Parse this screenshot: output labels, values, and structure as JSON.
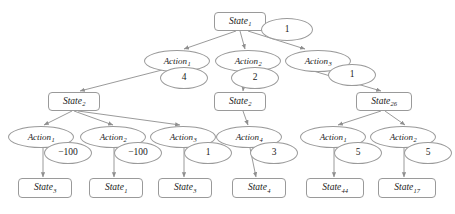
{
  "diagram": {
    "type": "expectimax-search-tree",
    "title": "",
    "node_shapes": {
      "state": "rounded-rectangle",
      "action": "ellipse",
      "value": "ellipse"
    },
    "colors": {
      "node_stroke": "#9a9a9a",
      "node_fill": "#ffffff",
      "edge_stroke": "#8f8f8f",
      "text": "#1a1a1a",
      "background": "#ffffff"
    },
    "nodes": [
      {
        "id": "s_root",
        "kind": "state",
        "base": "State",
        "sub": "1",
        "x": 214,
        "y": 12,
        "w": 52,
        "h": 19
      },
      {
        "id": "v_root",
        "kind": "value",
        "base": "1",
        "sub": "",
        "x": 261,
        "y": 18,
        "w": 52,
        "h": 23
      },
      {
        "id": "a1",
        "kind": "action",
        "base": "Action",
        "sub": "1",
        "x": 144,
        "y": 50,
        "w": 66,
        "h": 22
      },
      {
        "id": "v_a1",
        "kind": "value",
        "base": "4",
        "sub": "",
        "x": 160,
        "y": 67,
        "w": 48,
        "h": 22
      },
      {
        "id": "a2",
        "kind": "action",
        "base": "Action",
        "sub": "2",
        "x": 215,
        "y": 50,
        "w": 66,
        "h": 22
      },
      {
        "id": "v_a2",
        "kind": "value",
        "base": "2",
        "sub": "",
        "x": 231,
        "y": 67,
        "w": 48,
        "h": 22
      },
      {
        "id": "a3",
        "kind": "action",
        "base": "Action",
        "sub": "3",
        "x": 285,
        "y": 50,
        "w": 66,
        "h": 22
      },
      {
        "id": "v_a3",
        "kind": "value",
        "base": "1",
        "sub": "",
        "x": 328,
        "y": 64,
        "w": 48,
        "h": 22
      },
      {
        "id": "s_l",
        "kind": "state",
        "base": "State",
        "sub": "2",
        "x": 48,
        "y": 92,
        "w": 52,
        "h": 19
      },
      {
        "id": "s_m",
        "kind": "state",
        "base": "State",
        "sub": "2",
        "x": 214,
        "y": 92,
        "w": 52,
        "h": 19
      },
      {
        "id": "s_r",
        "kind": "state",
        "base": "State",
        "sub": "26",
        "x": 356,
        "y": 92,
        "w": 56,
        "h": 19
      },
      {
        "id": "b1",
        "kind": "action",
        "base": "Action",
        "sub": "1",
        "x": 8,
        "y": 126,
        "w": 66,
        "h": 22
      },
      {
        "id": "v_b1",
        "kind": "value",
        "base": "−100",
        "sub": "",
        "x": 44,
        "y": 142,
        "w": 48,
        "h": 22
      },
      {
        "id": "b2",
        "kind": "action",
        "base": "Action",
        "sub": "2",
        "x": 80,
        "y": 126,
        "w": 66,
        "h": 22
      },
      {
        "id": "v_b2",
        "kind": "value",
        "base": "−100",
        "sub": "",
        "x": 114,
        "y": 142,
        "w": 48,
        "h": 22
      },
      {
        "id": "b3",
        "kind": "action",
        "base": "Action",
        "sub": "3",
        "x": 150,
        "y": 126,
        "w": 66,
        "h": 22
      },
      {
        "id": "v_b3",
        "kind": "value",
        "base": "1",
        "sub": "",
        "x": 184,
        "y": 142,
        "w": 48,
        "h": 22
      },
      {
        "id": "b4",
        "kind": "action",
        "base": "Action",
        "sub": "4",
        "x": 216,
        "y": 126,
        "w": 66,
        "h": 22
      },
      {
        "id": "v_b4",
        "kind": "value",
        "base": "3",
        "sub": "",
        "x": 250,
        "y": 142,
        "w": 48,
        "h": 22
      },
      {
        "id": "b5",
        "kind": "action",
        "base": "Action",
        "sub": "1",
        "x": 300,
        "y": 126,
        "w": 66,
        "h": 22
      },
      {
        "id": "v_b5",
        "kind": "value",
        "base": "5",
        "sub": "",
        "x": 334,
        "y": 142,
        "w": 48,
        "h": 22
      },
      {
        "id": "b6",
        "kind": "action",
        "base": "Action",
        "sub": "2",
        "x": 370,
        "y": 126,
        "w": 66,
        "h": 22
      },
      {
        "id": "v_b6",
        "kind": "value",
        "base": "5",
        "sub": "",
        "x": 404,
        "y": 142,
        "w": 48,
        "h": 22
      },
      {
        "id": "t1",
        "kind": "state",
        "base": "State",
        "sub": "3",
        "x": 18,
        "y": 178,
        "w": 54,
        "h": 20
      },
      {
        "id": "t2",
        "kind": "state",
        "base": "State",
        "sub": "1",
        "x": 89,
        "y": 178,
        "w": 54,
        "h": 20
      },
      {
        "id": "t3",
        "kind": "state",
        "base": "State",
        "sub": "3",
        "x": 158,
        "y": 178,
        "w": 54,
        "h": 20
      },
      {
        "id": "t4",
        "kind": "state",
        "base": "State",
        "sub": "4",
        "x": 232,
        "y": 178,
        "w": 54,
        "h": 20
      },
      {
        "id": "t5",
        "kind": "state",
        "base": "State",
        "sub": "44",
        "x": 306,
        "y": 178,
        "w": 58,
        "h": 20
      },
      {
        "id": "t6",
        "kind": "state",
        "base": "State",
        "sub": "17",
        "x": 378,
        "y": 178,
        "w": 58,
        "h": 20
      }
    ],
    "edges": [
      {
        "from": "s_root",
        "to": "a1",
        "x1": 236,
        "y1": 31,
        "x2": 184,
        "y2": 49
      },
      {
        "from": "s_root",
        "to": "a2",
        "x1": 240,
        "y1": 31,
        "x2": 245,
        "y2": 49
      },
      {
        "from": "s_root",
        "to": "a3",
        "x1": 248,
        "y1": 31,
        "x2": 305,
        "y2": 49
      },
      {
        "from": "a1",
        "to": "s_l",
        "x1": 162,
        "y1": 70,
        "x2": 80,
        "y2": 91
      },
      {
        "from": "a2",
        "to": "s_m",
        "x1": 245,
        "y1": 72,
        "x2": 243,
        "y2": 91
      },
      {
        "from": "a3",
        "to": "s_r",
        "x1": 310,
        "y1": 70,
        "x2": 381,
        "y2": 91
      },
      {
        "from": "s_l",
        "to": "b1",
        "x1": 72,
        "y1": 111,
        "x2": 44,
        "y2": 125
      },
      {
        "from": "s_l",
        "to": "b2",
        "x1": 74,
        "y1": 111,
        "x2": 113,
        "y2": 125
      },
      {
        "from": "s_l",
        "to": "b3",
        "x1": 78,
        "y1": 111,
        "x2": 180,
        "y2": 125
      },
      {
        "from": "s_m",
        "to": "b4",
        "x1": 243,
        "y1": 111,
        "x2": 248,
        "y2": 125
      },
      {
        "from": "s_r",
        "to": "b5",
        "x1": 381,
        "y1": 111,
        "x2": 338,
        "y2": 125
      },
      {
        "from": "s_r",
        "to": "b6",
        "x1": 385,
        "y1": 111,
        "x2": 405,
        "y2": 125
      },
      {
        "from": "b1",
        "to": "t1",
        "x1": 43,
        "y1": 148,
        "x2": 43,
        "y2": 177
      },
      {
        "from": "b2",
        "to": "t2",
        "x1": 114,
        "y1": 148,
        "x2": 114,
        "y2": 177
      },
      {
        "from": "b3",
        "to": "t3",
        "x1": 184,
        "y1": 148,
        "x2": 184,
        "y2": 177
      },
      {
        "from": "b4",
        "to": "t4",
        "x1": 250,
        "y1": 148,
        "x2": 256,
        "y2": 177
      },
      {
        "from": "b5",
        "to": "t5",
        "x1": 334,
        "y1": 148,
        "x2": 334,
        "y2": 177
      },
      {
        "from": "b6",
        "to": "t6",
        "x1": 404,
        "y1": 148,
        "x2": 404,
        "y2": 177
      }
    ]
  }
}
